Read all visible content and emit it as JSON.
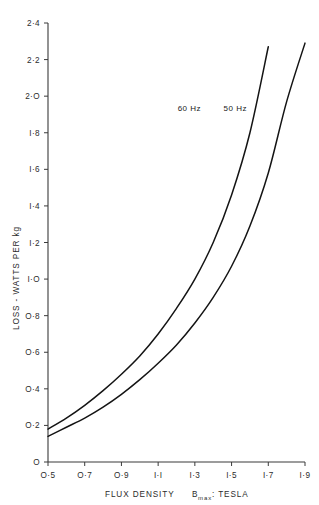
{
  "chart_data": {
    "type": "line",
    "title": "",
    "xlabel": "FLUX DENSITY  Bmax : TESLA",
    "xlabel_parts": {
      "main": "FLUX  DENSITY",
      "symbol": "B",
      "subscript": "max",
      "units": ": TESLA"
    },
    "ylabel": "LOSS - WATTS PER kg",
    "xlim": [
      0.5,
      1.9
    ],
    "ylim": [
      0,
      2.4
    ],
    "xticks": [
      "0.5",
      "0.7",
      "0.9",
      "1.1",
      "1.3",
      "1.5",
      "1.7",
      "1.9"
    ],
    "xtick_values": [
      0.5,
      0.7,
      0.9,
      1.1,
      1.3,
      1.5,
      1.7,
      1.9
    ],
    "xtick_display": [
      "O·5",
      "O·7",
      "O·9",
      "I·I",
      "I·3",
      "I·5",
      "I·7",
      "I·9"
    ],
    "yticks": [
      "0",
      "0.2",
      "0.4",
      "0.6",
      "0.8",
      "1.0",
      "1.2",
      "1.4",
      "1.6",
      "1.8",
      "2.0",
      "2.2",
      "2.4"
    ],
    "ytick_values": [
      0,
      0.2,
      0.4,
      0.6,
      0.8,
      1.0,
      1.2,
      1.4,
      1.6,
      1.8,
      2.0,
      2.2,
      2.4
    ],
    "ytick_display": [
      "O",
      "O·2",
      "O·4",
      "O·6",
      "O·8",
      "I·O",
      "I·2",
      "I·4",
      "I·6",
      "I·8",
      "2·O",
      "2·2",
      "2·4"
    ],
    "grid": false,
    "legend_position": "inline-curve-labels",
    "line_color": "#141414",
    "axis_color": "#3a3a3a",
    "background": "#ffffff",
    "series": [
      {
        "name": "60 Hz",
        "label": "60 Hz",
        "label_x": 1.27,
        "label_y": 1.92,
        "x": [
          0.5,
          0.6,
          0.7,
          0.8,
          0.9,
          1.0,
          1.1,
          1.2,
          1.3,
          1.4,
          1.5,
          1.6,
          1.7
        ],
        "values": [
          0.18,
          0.24,
          0.31,
          0.39,
          0.48,
          0.58,
          0.7,
          0.84,
          1.0,
          1.2,
          1.46,
          1.8,
          2.27
        ]
      },
      {
        "name": "50 Hz",
        "label": "50 Hz",
        "label_x": 1.52,
        "label_y": 1.92,
        "x": [
          0.5,
          0.6,
          0.7,
          0.8,
          0.9,
          1.0,
          1.1,
          1.2,
          1.3,
          1.4,
          1.5,
          1.6,
          1.7,
          1.8,
          1.9
        ],
        "values": [
          0.14,
          0.19,
          0.24,
          0.3,
          0.37,
          0.45,
          0.54,
          0.64,
          0.76,
          0.9,
          1.07,
          1.29,
          1.58,
          1.97,
          2.29
        ]
      }
    ]
  }
}
